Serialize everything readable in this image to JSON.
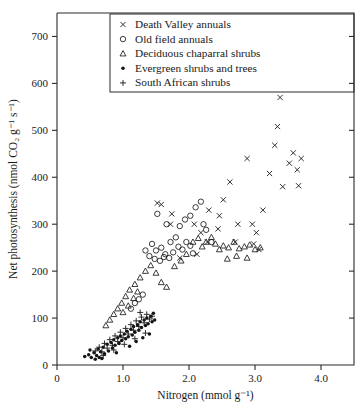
{
  "chart_data": {
    "type": "scatter",
    "title": "",
    "xlabel": "Nitrogen (mmol g⁻¹)",
    "ylabel": "Net photosynthesis (nmol CO₂ g⁻¹ s⁻¹)",
    "xlim": [
      0,
      4.5
    ],
    "ylim": [
      0,
      750
    ],
    "xticks": [
      0,
      1.0,
      2.0,
      3.0,
      4.0
    ],
    "xticklabels": [
      "0",
      "1.0",
      "2.0",
      "3.0",
      "4.0"
    ],
    "yticks": [
      0,
      100,
      200,
      300,
      400,
      500,
      600,
      700
    ],
    "yticklabels": [
      "0",
      "100",
      "200",
      "300",
      "400",
      "500",
      "600",
      "700"
    ],
    "grid": false,
    "legend_position": "top-left",
    "series": [
      {
        "name": "Death Valley annuals",
        "marker": "x",
        "points": [
          [
            1.52,
            345
          ],
          [
            1.58,
            342
          ],
          [
            1.74,
            322
          ],
          [
            1.72,
            300
          ],
          [
            2.08,
            300
          ],
          [
            2.28,
            262
          ],
          [
            2.12,
            236
          ],
          [
            1.86,
            228
          ],
          [
            2.3,
            330
          ],
          [
            2.46,
            318
          ],
          [
            2.62,
            390
          ],
          [
            2.52,
            352
          ],
          [
            2.74,
            300
          ],
          [
            2.7,
            262
          ],
          [
            2.88,
            440
          ],
          [
            2.96,
            300
          ],
          [
            3.02,
            282
          ],
          [
            3.12,
            330
          ],
          [
            3.22,
            408
          ],
          [
            3.3,
            468
          ],
          [
            3.38,
            570
          ],
          [
            3.34,
            508
          ],
          [
            3.42,
            380
          ],
          [
            3.52,
            430
          ],
          [
            3.58,
            452
          ],
          [
            3.64,
            416
          ],
          [
            3.7,
            440
          ],
          [
            3.66,
            382
          ],
          [
            2.98,
            258
          ],
          [
            3.06,
            246
          ],
          [
            2.44,
            290
          ],
          [
            2.18,
            282
          ]
        ]
      },
      {
        "name": "Old field annuals",
        "marker": "o",
        "points": [
          [
            1.52,
            322
          ],
          [
            1.66,
            300
          ],
          [
            1.8,
            272
          ],
          [
            1.86,
            296
          ],
          [
            1.94,
            310
          ],
          [
            2.02,
            318
          ],
          [
            2.1,
            336
          ],
          [
            2.18,
            348
          ],
          [
            1.44,
            258
          ],
          [
            1.5,
            244
          ],
          [
            1.58,
            250
          ],
          [
            1.64,
            236
          ],
          [
            1.72,
            262
          ],
          [
            1.76,
            240
          ],
          [
            1.84,
            252
          ],
          [
            1.9,
            246
          ],
          [
            1.96,
            262
          ],
          [
            2.02,
            254
          ],
          [
            2.06,
            238
          ],
          [
            1.4,
            232
          ],
          [
            1.48,
            226
          ],
          [
            1.56,
            222
          ],
          [
            1.62,
            230
          ],
          [
            1.7,
            228
          ],
          [
            1.34,
            244
          ],
          [
            2.22,
            300
          ],
          [
            2.26,
            288
          ],
          [
            1.3,
            150
          ],
          [
            1.24,
            140
          ],
          [
            1.18,
            132
          ],
          [
            1.12,
            120
          ],
          [
            2.34,
            262
          ]
        ]
      },
      {
        "name": "Deciduous chaparral shrubs",
        "marker": "^",
        "points": [
          [
            2.06,
            262
          ],
          [
            2.14,
            270
          ],
          [
            2.2,
            252
          ],
          [
            2.26,
            262
          ],
          [
            2.34,
            272
          ],
          [
            2.4,
            258
          ],
          [
            2.46,
            246
          ],
          [
            2.52,
            254
          ],
          [
            2.6,
            250
          ],
          [
            2.68,
            262
          ],
          [
            2.76,
            248
          ],
          [
            2.84,
            252
          ],
          [
            2.92,
            256
          ],
          [
            3.0,
            246
          ],
          [
            3.08,
            250
          ],
          [
            2.58,
            226
          ],
          [
            2.72,
            232
          ],
          [
            2.88,
            228
          ],
          [
            1.34,
            200
          ],
          [
            1.26,
            186
          ],
          [
            1.18,
            172
          ],
          [
            1.1,
            160
          ],
          [
            1.04,
            146
          ],
          [
            0.98,
            132
          ],
          [
            0.92,
            120
          ],
          [
            0.86,
            108
          ],
          [
            0.8,
            96
          ],
          [
            0.74,
            84
          ],
          [
            1.42,
            212
          ],
          [
            1.5,
            196
          ],
          [
            1.58,
            176
          ],
          [
            1.66,
            166
          ],
          [
            1.22,
            156
          ],
          [
            1.16,
            142
          ],
          [
            1.08,
            126
          ],
          [
            1.0,
            112
          ],
          [
            1.78,
            210
          ],
          [
            1.88,
            222
          ],
          [
            1.96,
            236
          ]
        ]
      },
      {
        "name": "Evergreen shrubs and trees",
        "marker": ".",
        "points": [
          [
            0.42,
            18
          ],
          [
            0.48,
            22
          ],
          [
            0.52,
            16
          ],
          [
            0.56,
            26
          ],
          [
            0.6,
            20
          ],
          [
            0.62,
            34
          ],
          [
            0.66,
            28
          ],
          [
            0.7,
            38
          ],
          [
            0.72,
            24
          ],
          [
            0.76,
            44
          ],
          [
            0.78,
            30
          ],
          [
            0.82,
            48
          ],
          [
            0.84,
            36
          ],
          [
            0.86,
            54
          ],
          [
            0.88,
            42
          ],
          [
            0.92,
            58
          ],
          [
            0.94,
            46
          ],
          [
            0.96,
            62
          ],
          [
            0.98,
            52
          ],
          [
            1.02,
            66
          ],
          [
            1.04,
            56
          ],
          [
            1.06,
            72
          ],
          [
            1.08,
            60
          ],
          [
            1.12,
            76
          ],
          [
            1.14,
            64
          ],
          [
            1.16,
            82
          ],
          [
            1.18,
            70
          ],
          [
            1.22,
            86
          ],
          [
            1.24,
            74
          ],
          [
            1.26,
            92
          ],
          [
            1.28,
            80
          ],
          [
            1.32,
            96
          ],
          [
            1.34,
            84
          ],
          [
            1.36,
            100
          ],
          [
            1.38,
            88
          ],
          [
            1.42,
            104
          ],
          [
            1.44,
            92
          ],
          [
            0.5,
            32
          ],
          [
            0.58,
            12
          ],
          [
            0.64,
            16
          ],
          [
            0.68,
            14
          ],
          [
            0.9,
            26
          ],
          [
            1.1,
            40
          ],
          [
            1.2,
            50
          ],
          [
            1.3,
            58
          ],
          [
            1.4,
            66
          ],
          [
            1.46,
            110
          ],
          [
            1.48,
            96
          ]
        ]
      },
      {
        "name": "South African shrubs",
        "marker": "+",
        "points": [
          [
            0.58,
            30
          ],
          [
            0.64,
            38
          ],
          [
            0.68,
            28
          ],
          [
            0.72,
            46
          ],
          [
            0.76,
            36
          ],
          [
            0.8,
            54
          ],
          [
            0.84,
            42
          ],
          [
            0.88,
            62
          ],
          [
            0.92,
            50
          ],
          [
            0.96,
            70
          ],
          [
            1.0,
            58
          ],
          [
            1.04,
            78
          ],
          [
            1.08,
            66
          ],
          [
            1.12,
            86
          ],
          [
            1.16,
            74
          ],
          [
            1.2,
            94
          ],
          [
            1.24,
            82
          ],
          [
            1.28,
            102
          ],
          [
            1.32,
            90
          ],
          [
            1.36,
            108
          ],
          [
            1.4,
            98
          ],
          [
            0.7,
            20
          ],
          [
            0.86,
            32
          ],
          [
            1.02,
            44
          ],
          [
            1.18,
            56
          ],
          [
            1.34,
            68
          ],
          [
            1.26,
            112
          ],
          [
            1.44,
            104
          ]
        ]
      }
    ]
  },
  "legend": {
    "entries": [
      {
        "marker": "×",
        "label": "Death Valley annuals"
      },
      {
        "marker": "○",
        "label": "Old field annuals"
      },
      {
        "marker": "△",
        "label": "Deciduous chaparral shrubs"
      },
      {
        "marker": "•",
        "label": "Evergreen shrubs and trees"
      },
      {
        "marker": "+",
        "label": "South African shrubs"
      }
    ]
  },
  "style": {
    "marker_color": "#1a1a1a",
    "axis_color": "#2b2b2b",
    "background": "#ffffff"
  }
}
